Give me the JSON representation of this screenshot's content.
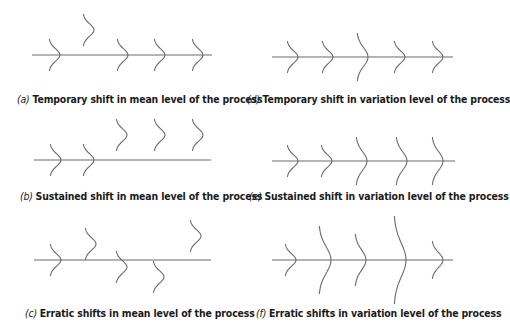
{
  "figure": {
    "colors": {
      "line": "#6b6b6b",
      "text": "#1a1a1a",
      "background": "#ffffff"
    },
    "panels": [
      {
        "id": "a",
        "label": "(a)",
        "caption": "Temporary shift in mean level of the process",
        "axis": {
          "x1": 32,
          "x2": 212,
          "y": 55
        },
        "caption_pos": {
          "x": 17,
          "y": 94
        },
        "curves": [
          {
            "x": 60,
            "y": 55,
            "h": 16,
            "w": 11
          },
          {
            "x": 94,
            "y": 30,
            "h": 16,
            "w": 11
          },
          {
            "x": 128,
            "y": 55,
            "h": 16,
            "w": 11
          },
          {
            "x": 165,
            "y": 55,
            "h": 16,
            "w": 11
          },
          {
            "x": 203,
            "y": 55,
            "h": 16,
            "w": 11
          }
        ]
      },
      {
        "id": "b",
        "label": "(b)",
        "caption": "Sustained shift in mean level of the process",
        "axis": {
          "x1": 34,
          "x2": 211,
          "y": 160
        },
        "caption_pos": {
          "x": 20,
          "y": 191
        },
        "curves": [
          {
            "x": 61,
            "y": 160,
            "h": 16,
            "w": 11
          },
          {
            "x": 94,
            "y": 160,
            "h": 16,
            "w": 11
          },
          {
            "x": 127,
            "y": 135,
            "h": 16,
            "w": 11
          },
          {
            "x": 165,
            "y": 135,
            "h": 16,
            "w": 11
          },
          {
            "x": 203,
            "y": 135,
            "h": 16,
            "w": 11
          }
        ]
      },
      {
        "id": "c",
        "label": "(c)",
        "caption": "Erratic shifts in mean level of the process",
        "axis": {
          "x1": 34,
          "x2": 211,
          "y": 260
        },
        "caption_pos": {
          "x": 25,
          "y": 308
        },
        "curves": [
          {
            "x": 61,
            "y": 260,
            "h": 16,
            "w": 11
          },
          {
            "x": 96,
            "y": 244,
            "h": 16,
            "w": 11
          },
          {
            "x": 127,
            "y": 267,
            "h": 16,
            "w": 11
          },
          {
            "x": 164,
            "y": 277,
            "h": 16,
            "w": 11
          },
          {
            "x": 201,
            "y": 236,
            "h": 16,
            "w": 11
          }
        ]
      },
      {
        "id": "d",
        "label": "(d)",
        "caption": "Temporary shift in variation level of the process",
        "axis": {
          "x1": 272,
          "x2": 453,
          "y": 57
        },
        "caption_pos": {
          "x": 247,
          "y": 94
        },
        "curves": [
          {
            "x": 298,
            "y": 57,
            "h": 16,
            "w": 11
          },
          {
            "x": 333,
            "y": 57,
            "h": 16,
            "w": 11
          },
          {
            "x": 368,
            "y": 57,
            "h": 24,
            "w": 11
          },
          {
            "x": 405,
            "y": 57,
            "h": 16,
            "w": 11
          },
          {
            "x": 443,
            "y": 57,
            "h": 16,
            "w": 11
          }
        ]
      },
      {
        "id": "e",
        "label": "(e)",
        "caption": "Sustained shift in variation level of the process",
        "axis": {
          "x1": 272,
          "x2": 455,
          "y": 161
        },
        "caption_pos": {
          "x": 249,
          "y": 191
        },
        "curves": [
          {
            "x": 298,
            "y": 161,
            "h": 16,
            "w": 11
          },
          {
            "x": 332,
            "y": 161,
            "h": 16,
            "w": 11
          },
          {
            "x": 367,
            "y": 161,
            "h": 24,
            "w": 11
          },
          {
            "x": 407,
            "y": 161,
            "h": 24,
            "w": 11
          },
          {
            "x": 443,
            "y": 161,
            "h": 24,
            "w": 11
          }
        ]
      },
      {
        "id": "f",
        "label": "(f)",
        "caption": "Erratic shifts in variation level of the process",
        "axis": {
          "x1": 272,
          "x2": 453,
          "y": 260
        },
        "caption_pos": {
          "x": 256,
          "y": 308
        },
        "curves": [
          {
            "x": 296,
            "y": 260,
            "h": 16,
            "w": 11
          },
          {
            "x": 331,
            "y": 260,
            "h": 34,
            "w": 12
          },
          {
            "x": 366,
            "y": 260,
            "h": 26,
            "w": 11
          },
          {
            "x": 406,
            "y": 260,
            "h": 44,
            "w": 12
          },
          {
            "x": 443,
            "y": 260,
            "h": 19,
            "w": 11
          }
        ]
      }
    ]
  }
}
